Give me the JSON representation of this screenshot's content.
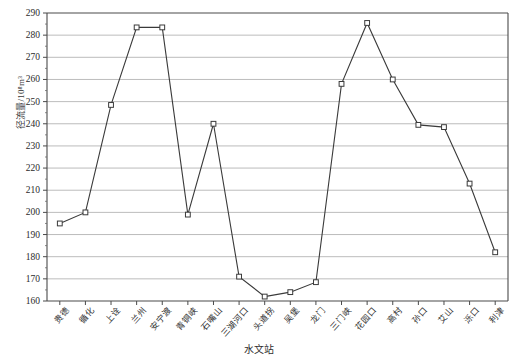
{
  "axis": {
    "y_title": "径流量/10⁸m³",
    "x_title": "水文站",
    "y_ticks": [
      "290",
      "280",
      "270",
      "260",
      "250",
      "240",
      "230",
      "220",
      "210",
      "200",
      "190",
      "180",
      "170",
      "160"
    ]
  },
  "chart_data": {
    "type": "line",
    "title": "",
    "xlabel": "水文站",
    "ylabel": "径流量/10⁸m³",
    "ylim": [
      160,
      290
    ],
    "ytick_step": 10,
    "grid": true,
    "legend": "none",
    "marker": "open-square",
    "line_color": "#3a3a3a",
    "grid_color": "#b4b4b4",
    "categories": [
      "贵德",
      "循化",
      "上诠",
      "兰州",
      "安宁渡",
      "青铜峡",
      "石嘴山",
      "三湖河口",
      "头道拐",
      "吴堡",
      "龙门",
      "三门峡",
      "花园口",
      "高村",
      "孙口",
      "艾山",
      "泺口",
      "利津"
    ],
    "values": [
      195,
      200,
      248.5,
      283.5,
      283.5,
      199,
      240,
      171,
      162,
      164,
      168.5,
      258,
      285.5,
      260,
      239.5,
      238.5,
      213,
      182
    ]
  }
}
